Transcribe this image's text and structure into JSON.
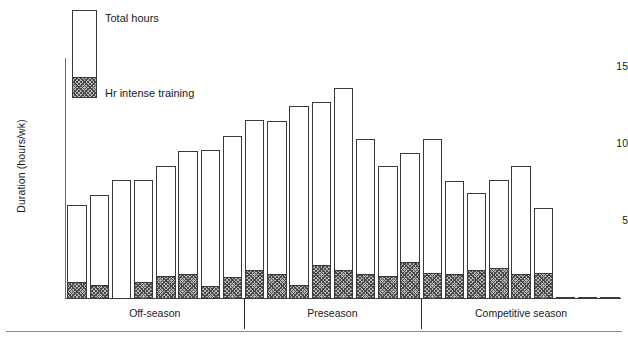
{
  "chart_data": {
    "type": "bar",
    "title": "",
    "subtitle": "",
    "xlabel": "",
    "ylabel": "Duration (hours/wk)",
    "ylim": [
      0,
      16
    ],
    "yticks": [
      5,
      10,
      15
    ],
    "ytick_labels": [
      "5",
      "10",
      "15"
    ],
    "grid": false,
    "legend_position": "top-left",
    "stacked": true,
    "legend": [
      {
        "key": "total",
        "label": "Total hours",
        "swatch": "open-white-box"
      },
      {
        "key": "intense",
        "label": "Hr intense training",
        "swatch": "hatched-box"
      }
    ],
    "groups": [
      {
        "name": "Off-season",
        "n_bars": 8
      },
      {
        "name": "Preseason",
        "n_bars": 8
      },
      {
        "name": "Competitive season",
        "n_bars": 9
      }
    ],
    "categories": [
      "1",
      "2",
      "3",
      "4",
      "5",
      "6",
      "7",
      "8",
      "9",
      "10",
      "11",
      "12",
      "13",
      "14",
      "15",
      "16",
      "17",
      "18",
      "19",
      "20",
      "21",
      "22",
      "23",
      "24",
      "25"
    ],
    "series": [
      {
        "name": "Total hours",
        "values": [
          6.2,
          6.9,
          7.9,
          7.9,
          8.8,
          9.8,
          9.9,
          10.8,
          11.9,
          11.8,
          12.8,
          13.1,
          14.0,
          10.6,
          8.8,
          9.7,
          10.6,
          7.8,
          7.0,
          7.9,
          8.8,
          6.0,
          0,
          0,
          0
        ]
      },
      {
        "name": "Hr intense training",
        "values": [
          1.1,
          0.9,
          0.0,
          1.1,
          1.5,
          1.6,
          0.8,
          1.4,
          1.9,
          1.6,
          0.9,
          2.2,
          1.9,
          1.6,
          1.5,
          2.4,
          1.7,
          1.6,
          1.9,
          2.0,
          1.6,
          1.7,
          0,
          0,
          0
        ]
      }
    ],
    "annotations": []
  },
  "axis": {
    "y_title": "Duration (hours/wk)",
    "ticks": [
      "15",
      "10",
      "5"
    ]
  },
  "legend": {
    "total_label": "Total hours",
    "intense_label": "Hr intense training"
  },
  "sections": {
    "off_season": "Off-season",
    "preseason": "Preseason",
    "competitive_season": "Competitive season"
  },
  "colors": {
    "axis": "#6b6b6b",
    "bar_outline": "#3a3a3a",
    "bar_fill": "#ffffff",
    "hatch_fill": "#b9b9b9",
    "hatch_stroke": "#4a4a4a",
    "text": "#1a1a1a",
    "background": "#ffffff"
  }
}
